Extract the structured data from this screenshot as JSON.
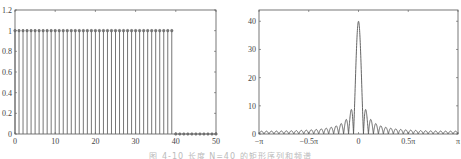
{
  "caption": "图 4-10  长度 N=40 的矩形序列和频谱",
  "chart_data": [
    {
      "type": "stem",
      "title": "",
      "xlabel": "",
      "ylabel": "",
      "xlim": [
        0,
        50
      ],
      "ylim": [
        0,
        1.2
      ],
      "x_ticks": [
        0,
        10,
        20,
        30,
        40,
        50
      ],
      "x_tick_labels": [
        "0",
        "10",
        "20",
        "30",
        "40",
        "50"
      ],
      "y_ticks": [
        0,
        0.2,
        0.4,
        0.6,
        0.8,
        1,
        1.2
      ],
      "y_tick_labels": [
        "0",
        "0.2",
        "0.4",
        "0.6",
        "0.8",
        "1",
        "1.2"
      ],
      "grid": false,
      "series": [
        {
          "name": "x(n)",
          "description": "rectangular sequence, 1 for n=0..39, 0 for n=40..50",
          "x": [
            0,
            1,
            2,
            3,
            4,
            5,
            6,
            7,
            8,
            9,
            10,
            11,
            12,
            13,
            14,
            15,
            16,
            17,
            18,
            19,
            20,
            21,
            22,
            23,
            24,
            25,
            26,
            27,
            28,
            29,
            30,
            31,
            32,
            33,
            34,
            35,
            36,
            37,
            38,
            39,
            40,
            41,
            42,
            43,
            44,
            45,
            46,
            47,
            48,
            49,
            50
          ],
          "values": [
            1,
            1,
            1,
            1,
            1,
            1,
            1,
            1,
            1,
            1,
            1,
            1,
            1,
            1,
            1,
            1,
            1,
            1,
            1,
            1,
            1,
            1,
            1,
            1,
            1,
            1,
            1,
            1,
            1,
            1,
            1,
            1,
            1,
            1,
            1,
            1,
            1,
            1,
            1,
            1,
            0,
            0,
            0,
            0,
            0,
            0,
            0,
            0,
            0,
            0,
            0
          ]
        }
      ]
    },
    {
      "type": "line",
      "title": "",
      "xlabel": "",
      "ylabel": "",
      "xlim": [
        "-π",
        "π"
      ],
      "ylim": [
        0,
        44
      ],
      "x_ticks": [
        -3.14159,
        -1.5708,
        0,
        1.5708,
        3.14159
      ],
      "x_tick_labels": [
        "−π",
        "−0.5π",
        "0",
        "0.5π",
        "π"
      ],
      "y_ticks": [
        0,
        10,
        20,
        30,
        40
      ],
      "y_tick_labels": [
        "0",
        "10",
        "20",
        "30",
        "40"
      ],
      "grid": false,
      "series": [
        {
          "name": "|X(e^jω)|",
          "description": "magnitude spectrum |sin(20ω)/sin(ω/2)| of N=40 rectangular sequence; main lobe peak 40 at ω=0, first sidelobes ≈ 8.9",
          "N": 40,
          "peak": 40,
          "first_sidelobe": 8.9
        }
      ]
    }
  ]
}
